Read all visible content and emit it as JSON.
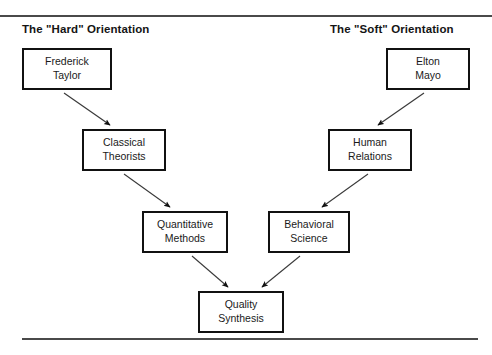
{
  "diagram": {
    "title_left": "The \"Hard\" Orientation",
    "title_right": "The \"Soft\" Orientation",
    "accent_color": "#111111",
    "rule_color": "#4a4a4a",
    "background_color": "#ffffff",
    "nodes": [
      {
        "id": "frederick-taylor",
        "label": "Frederick\nTaylor",
        "column": "hard",
        "row": 1
      },
      {
        "id": "elton-mayo",
        "label": "Elton\nMayo",
        "column": "soft",
        "row": 1
      },
      {
        "id": "classical-theorists",
        "label": "Classical\nTheorists",
        "column": "hard",
        "row": 2
      },
      {
        "id": "human-relations",
        "label": "Human\nRelations",
        "column": "soft",
        "row": 2
      },
      {
        "id": "quantitative-methods",
        "label": "Quantitative\nMethods",
        "column": "hard",
        "row": 3
      },
      {
        "id": "behavioral-science",
        "label": "Behavioral\nScience",
        "column": "soft",
        "row": 3
      },
      {
        "id": "quality-synthesis",
        "label": "Quality\nSynthesis",
        "column": "center",
        "row": 4
      }
    ],
    "edges": [
      {
        "from": "frederick-taylor",
        "to": "classical-theorists",
        "direction": "down-right"
      },
      {
        "from": "elton-mayo",
        "to": "human-relations",
        "direction": "down-left"
      },
      {
        "from": "classical-theorists",
        "to": "quantitative-methods",
        "direction": "down-right"
      },
      {
        "from": "human-relations",
        "to": "behavioral-science",
        "direction": "down-left"
      },
      {
        "from": "quantitative-methods",
        "to": "quality-synthesis",
        "direction": "down-right"
      },
      {
        "from": "behavioral-science",
        "to": "quality-synthesis",
        "direction": "down-left"
      }
    ]
  }
}
